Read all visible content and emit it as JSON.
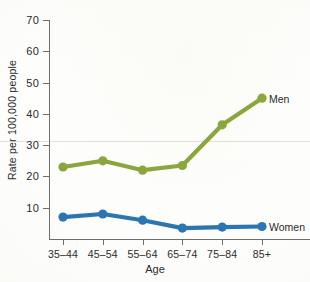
{
  "chart_data": {
    "type": "line",
    "title": "",
    "xlabel": "Age",
    "ylabel": "Rate per 100,000 people",
    "categories": [
      "35–44",
      "45–54",
      "55–64",
      "65–74",
      "75–84",
      "85+"
    ],
    "ylim": [
      0,
      70
    ],
    "yticks": [
      10,
      20,
      30,
      40,
      50,
      60,
      70
    ],
    "grid": false,
    "legend_position": "inline-right",
    "series": [
      {
        "name": "Men",
        "color": "#8aa63c",
        "values": [
          23,
          25,
          22,
          23.5,
          36.5,
          45
        ]
      },
      {
        "name": "Women",
        "color": "#2b75b3",
        "values": [
          7,
          8,
          6,
          3.5,
          3.8,
          4
        ]
      }
    ]
  },
  "labels": {
    "men": "Men",
    "women": "Women"
  }
}
